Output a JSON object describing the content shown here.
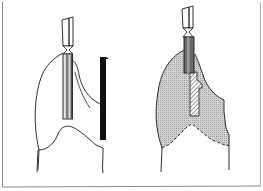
{
  "figure": {
    "panels": [
      {
        "id": "left",
        "elements": [
          "bur-shank",
          "bur-neck",
          "cylindrical-bur",
          "tooth-outline",
          "matrix-strip",
          "roots"
        ]
      },
      {
        "id": "right",
        "elements": [
          "bur-shank",
          "bur-neck",
          "cylindrical-bur",
          "shaded-tooth",
          "hatched-preparation",
          "dashed-margin",
          "roots"
        ]
      }
    ],
    "colors": {
      "line": "#1a1a1a",
      "matrix": "#111111",
      "shading": "#c8c8c8",
      "bur_fill": "#8a8a8a",
      "frame": "#888888",
      "background": "#ffffff"
    }
  }
}
